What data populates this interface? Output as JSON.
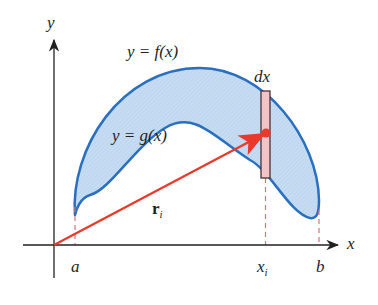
{
  "figure": {
    "type": "centroid-of-region-diagram",
    "labels": {
      "y_axis": "y",
      "x_axis": "x",
      "upper_curve": "y = f(x)",
      "lower_curve": "y = g(x)",
      "strip_width": "dx",
      "position_vector": "r",
      "position_vector_sub": "i",
      "left_bound": "a",
      "right_bound": "b",
      "strip_x": "x",
      "strip_x_sub": "i"
    },
    "colors": {
      "region_fill": "#c5dcf2",
      "curve_stroke": "#2a6fc0",
      "vector": "#e8392a",
      "strip_fill": "#f2c4c8",
      "strip_stroke": "#4a3236",
      "dashed": "#d9727a",
      "axis": "#231f20"
    }
  }
}
